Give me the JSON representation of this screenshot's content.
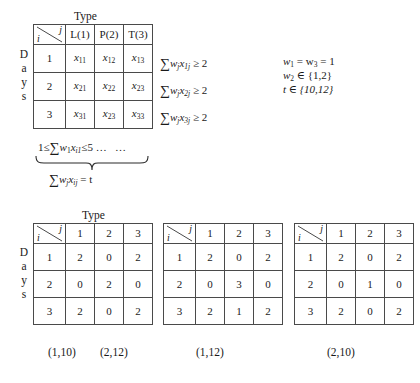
{
  "figure": {
    "top_table": {
      "type_label": "Type",
      "days_label": "Days",
      "corner": {
        "row_symbol": "i",
        "col_symbol": "j"
      },
      "column_headers": [
        "L(1)",
        "P(2)",
        "T(3)"
      ],
      "row_headers": [
        "1",
        "2",
        "3"
      ],
      "cells": [
        [
          "x",
          "x",
          "x"
        ],
        [
          "x",
          "x",
          "x"
        ],
        [
          "x",
          "x",
          "x"
        ]
      ],
      "cell_subscripts": [
        [
          "11",
          "12",
          "13"
        ],
        [
          "21",
          "22",
          "23"
        ],
        [
          "31",
          "23",
          "33"
        ]
      ]
    },
    "row_constraints": [
      {
        "sigma": "∑",
        "var": "w",
        "var_sub": "j",
        "x": "x",
        "x_sub": "1j",
        "rel": "≥ 2"
      },
      {
        "sigma": "∑",
        "var": "w",
        "var_sub": "j",
        "x": "x",
        "x_sub": "2j",
        "rel": "≥ 2"
      },
      {
        "sigma": "∑",
        "var": "w",
        "var_sub": "j",
        "x": "x",
        "x_sub": "3j",
        "rel": "≥ 2"
      }
    ],
    "row_constraint_text": [
      "∑w_j x_1j ≥ 2",
      "∑w_j x_2j ≥ 2",
      "∑w_j x_3j ≥ 2"
    ],
    "column_constraint": {
      "lead": "1≤",
      "sigma": "∑",
      "w": "w",
      "w_sub": "1",
      "x": "x",
      "x_sub": "i1",
      "tail": "≤5",
      "dots_1": "…",
      "dots_2": "…"
    },
    "brace_label": {
      "sigma": "∑",
      "w": "w",
      "w_sub": "j",
      "x": "x",
      "x_sub": "ij",
      "eq": "= t"
    },
    "parameter_notes": [
      {
        "text": "w",
        "sub1": "1",
        "mid": " = w",
        "sub2": "3",
        "tail": " = 1"
      },
      {
        "text": "w",
        "sub1": "2",
        "mid": " ∈ {1,2}",
        "sub2": "",
        "tail": ""
      },
      {
        "text": "t ∈ {10,12}",
        "sub1": "",
        "mid": "",
        "sub2": "",
        "tail": ""
      }
    ],
    "parameter_notes_plain": [
      "w₁ = w₃ = 1",
      "w₂ ∈ {1,2}",
      "t ∈ {10,12}"
    ],
    "solution_tables": [
      {
        "type_label": "Type",
        "days_label": "Days",
        "show_type_label": true,
        "show_days_label": true,
        "corner": {
          "row_symbol": "i",
          "col_symbol": "j"
        },
        "column_headers": [
          "1",
          "2",
          "3"
        ],
        "row_headers": [
          "1",
          "2",
          "3"
        ],
        "values": [
          [
            "2",
            "0",
            "2"
          ],
          [
            "0",
            "2",
            "0"
          ],
          [
            "2",
            "0",
            "2"
          ]
        ],
        "captions": [
          "(1,10)",
          "(2,12)"
        ]
      },
      {
        "type_label": "",
        "days_label": "",
        "show_type_label": false,
        "show_days_label": false,
        "corner": {
          "row_symbol": "i",
          "col_symbol": "j"
        },
        "column_headers": [
          "1",
          "2",
          "3"
        ],
        "row_headers": [
          "1",
          "2",
          "3"
        ],
        "values": [
          [
            "2",
            "0",
            "2"
          ],
          [
            "0",
            "3",
            "0"
          ],
          [
            "2",
            "1",
            "2"
          ]
        ],
        "captions": [
          "(1,12)"
        ]
      },
      {
        "type_label": "",
        "days_label": "",
        "show_type_label": false,
        "show_days_label": false,
        "corner": {
          "row_symbol": "i",
          "col_symbol": "j"
        },
        "column_headers": [
          "1",
          "2",
          "3"
        ],
        "row_headers": [
          "1",
          "2",
          "3"
        ],
        "values": [
          [
            "2",
            "0",
            "2"
          ],
          [
            "0",
            "1",
            "0"
          ],
          [
            "2",
            "0",
            "2"
          ]
        ],
        "captions": [
          "(2,10)"
        ]
      }
    ]
  },
  "colors": {
    "line": "#4a4a4a",
    "text": "#1a1a1a",
    "background": "#ffffff"
  }
}
